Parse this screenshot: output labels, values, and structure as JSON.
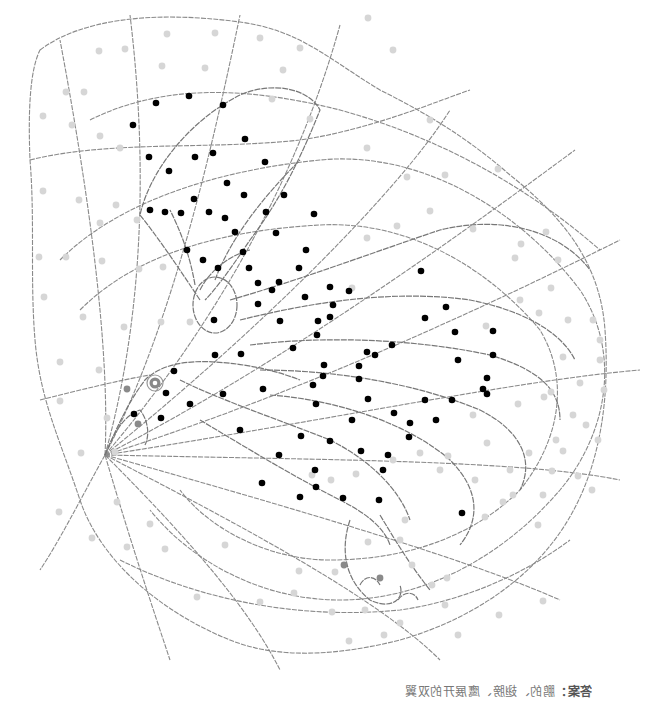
{
  "worksheet": {
    "type": "hidden-picture coloring page",
    "subject": "eagle with spread wings inside a spider-web grid",
    "line_color": "#8a8a8a",
    "dot_colors": {
      "dark": "#000000",
      "mid": "#8a8a8a",
      "light": "#d6d6d6"
    }
  },
  "caption": {
    "lead": "答案：",
    "text": "鹏的、翅膀、鹰展开的双翼",
    "mirrored": true
  },
  "eye": {
    "x": 155,
    "y": 383
  },
  "dots": {
    "dark": [
      [
        156,
        103
      ],
      [
        189,
        96
      ],
      [
        223,
        105
      ],
      [
        133,
        125
      ],
      [
        245,
        139
      ],
      [
        149,
        157
      ],
      [
        195,
        157
      ],
      [
        213,
        153
      ],
      [
        265,
        162
      ],
      [
        169,
        171
      ],
      [
        194,
        199
      ],
      [
        227,
        183
      ],
      [
        244,
        195
      ],
      [
        284,
        195
      ],
      [
        150,
        210
      ],
      [
        165,
        212
      ],
      [
        181,
        213
      ],
      [
        209,
        212
      ],
      [
        225,
        218
      ],
      [
        235,
        232
      ],
      [
        266,
        212
      ],
      [
        314,
        214
      ],
      [
        276,
        233
      ],
      [
        187,
        250
      ],
      [
        203,
        260
      ],
      [
        218,
        268
      ],
      [
        243,
        252
      ],
      [
        249,
        268
      ],
      [
        258,
        283
      ],
      [
        279,
        282
      ],
      [
        306,
        250
      ],
      [
        299,
        268
      ],
      [
        272,
        290
      ],
      [
        305,
        297
      ],
      [
        330,
        287
      ],
      [
        214,
        320
      ],
      [
        258,
        304
      ],
      [
        280,
        321
      ],
      [
        318,
        321
      ],
      [
        215,
        355
      ],
      [
        241,
        354
      ],
      [
        293,
        348
      ],
      [
        317,
        335
      ],
      [
        330,
        317
      ],
      [
        324,
        365
      ],
      [
        323,
        376
      ],
      [
        313,
        385
      ],
      [
        174,
        371
      ],
      [
        166,
        393
      ],
      [
        190,
        404
      ],
      [
        134,
        414
      ],
      [
        161,
        418
      ],
      [
        223,
        394
      ],
      [
        240,
        430
      ],
      [
        301,
        436
      ],
      [
        279,
        455
      ],
      [
        315,
        470
      ],
      [
        262,
        483
      ],
      [
        300,
        497
      ],
      [
        316,
        487
      ],
      [
        333,
        305
      ],
      [
        349,
        291
      ],
      [
        367,
        352
      ],
      [
        359,
        366
      ],
      [
        368,
        399
      ],
      [
        375,
        355
      ],
      [
        392,
        345
      ],
      [
        421,
        271
      ],
      [
        425,
        318
      ],
      [
        446,
        307
      ],
      [
        455,
        332
      ],
      [
        458,
        360
      ],
      [
        487,
        378
      ],
      [
        493,
        331
      ],
      [
        493,
        355
      ],
      [
        483,
        389
      ],
      [
        487,
        394
      ],
      [
        330,
        441
      ],
      [
        352,
        420
      ],
      [
        361,
        451
      ],
      [
        383,
        470
      ],
      [
        343,
        498
      ],
      [
        379,
        500
      ],
      [
        410,
        423
      ],
      [
        394,
        413
      ],
      [
        409,
        437
      ],
      [
        436,
        420
      ],
      [
        452,
        400
      ],
      [
        462,
        513
      ],
      [
        425,
        400
      ],
      [
        359,
        379
      ],
      [
        388,
        455
      ],
      [
        316,
        404
      ],
      [
        263,
        389
      ]
    ],
    "mid": [
      [
        127,
        389
      ],
      [
        138,
        424
      ],
      [
        344,
        565
      ],
      [
        380,
        578
      ]
    ],
    "light": [
      [
        99,
        51
      ],
      [
        125,
        49
      ],
      [
        167,
        34
      ],
      [
        215,
        33
      ],
      [
        205,
        68
      ],
      [
        162,
        66
      ],
      [
        260,
        38
      ],
      [
        300,
        48
      ],
      [
        283,
        70
      ],
      [
        310,
        119
      ],
      [
        272,
        99
      ],
      [
        66,
        92
      ],
      [
        84,
        92
      ],
      [
        43,
        116
      ],
      [
        72,
        125
      ],
      [
        100,
        136
      ],
      [
        120,
        148
      ],
      [
        43,
        191
      ],
      [
        79,
        200
      ],
      [
        116,
        205
      ],
      [
        137,
        220
      ],
      [
        100,
        223
      ],
      [
        39,
        257
      ],
      [
        66,
        257
      ],
      [
        102,
        261
      ],
      [
        139,
        269
      ],
      [
        163,
        267
      ],
      [
        44,
        297
      ],
      [
        83,
        317
      ],
      [
        124,
        327
      ],
      [
        161,
        322
      ],
      [
        190,
        322
      ],
      [
        60,
        362
      ],
      [
        99,
        370
      ],
      [
        60,
        401
      ],
      [
        107,
        418
      ],
      [
        81,
        453
      ],
      [
        115,
        452
      ],
      [
        117,
        502
      ],
      [
        59,
        512
      ],
      [
        150,
        524
      ],
      [
        92,
        538
      ],
      [
        127,
        547
      ],
      [
        165,
        549
      ],
      [
        225,
        545
      ],
      [
        197,
        597
      ],
      [
        260,
        602
      ],
      [
        294,
        593
      ],
      [
        335,
        572
      ],
      [
        312,
        475
      ],
      [
        331,
        480
      ],
      [
        356,
        474
      ],
      [
        393,
        460
      ],
      [
        420,
        453
      ],
      [
        448,
        456
      ],
      [
        475,
        480
      ],
      [
        510,
        470
      ],
      [
        518,
        404
      ],
      [
        487,
        443
      ],
      [
        473,
        415
      ],
      [
        440,
        470
      ],
      [
        368,
        18
      ],
      [
        393,
        50
      ],
      [
        430,
        120
      ],
      [
        367,
        148
      ],
      [
        407,
        177
      ],
      [
        367,
        238
      ],
      [
        352,
        288
      ],
      [
        430,
        211
      ],
      [
        397,
        226
      ],
      [
        445,
        175
      ],
      [
        498,
        169
      ],
      [
        473,
        229
      ],
      [
        521,
        244
      ],
      [
        546,
        232
      ],
      [
        515,
        258
      ],
      [
        558,
        260
      ],
      [
        551,
        288
      ],
      [
        539,
        313
      ],
      [
        568,
        320
      ],
      [
        593,
        320
      ],
      [
        600,
        340
      ],
      [
        520,
        300
      ],
      [
        486,
        326
      ],
      [
        563,
        357
      ],
      [
        600,
        360
      ],
      [
        604,
        390
      ],
      [
        580,
        383
      ],
      [
        551,
        392
      ],
      [
        544,
        397
      ],
      [
        573,
        415
      ],
      [
        586,
        425
      ],
      [
        598,
        440
      ],
      [
        563,
        451
      ],
      [
        578,
        476
      ],
      [
        592,
        490
      ],
      [
        552,
        471
      ],
      [
        529,
        453
      ],
      [
        556,
        440
      ],
      [
        513,
        495
      ],
      [
        543,
        495
      ],
      [
        538,
        525
      ],
      [
        503,
        502
      ],
      [
        485,
        517
      ],
      [
        400,
        540
      ],
      [
        412,
        565
      ],
      [
        368,
        542
      ],
      [
        365,
        610
      ],
      [
        299,
        571
      ],
      [
        332,
        612
      ],
      [
        384,
        635
      ],
      [
        349,
        641
      ],
      [
        400,
        623
      ],
      [
        447,
        578
      ],
      [
        458,
        635
      ],
      [
        499,
        615
      ],
      [
        445,
        605
      ],
      [
        432,
        585
      ],
      [
        543,
        601
      ],
      [
        405,
        520
      ]
    ]
  }
}
